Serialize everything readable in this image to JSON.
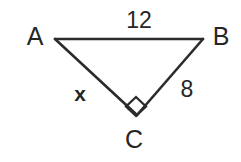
{
  "figure": {
    "kind": "right-triangle-diagram",
    "background_color": "#ffffff",
    "stroke_color": "#2b2b2b",
    "text_color": "#262626",
    "canvas": {
      "width": 241,
      "height": 162
    }
  },
  "vertices": {
    "a": {
      "label": "A",
      "x": 55,
      "y": 39,
      "label_x": 35,
      "label_y": 36
    },
    "b": {
      "label": "B",
      "x": 203,
      "y": 39,
      "label_x": 221,
      "label_y": 36
    },
    "c": {
      "label": "C",
      "x": 137,
      "y": 115,
      "label_x": 134,
      "label_y": 139
    }
  },
  "sides": {
    "ab": {
      "label": "12",
      "label_x": 139,
      "label_y": 20
    },
    "ac": {
      "label": "x",
      "label_x": 80,
      "label_y": 93
    },
    "bc": {
      "label": "8",
      "label_x": 187,
      "label_y": 89
    }
  },
  "right_angle": {
    "at_vertex": "C",
    "marker": "right-angle-square",
    "center_x": 136,
    "center_y": 106,
    "size": 10
  }
}
